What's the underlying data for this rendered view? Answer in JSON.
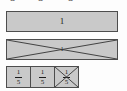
{
  "diagram": {
    "type": "fraction-bar-model",
    "clipped_top_row": {
      "note": "partially cut-off digits along the top edge",
      "glyphs": [
        "5",
        "5",
        "5"
      ]
    },
    "bars": [
      {
        "id": "whole",
        "label": "1",
        "crossed_out": false,
        "fill_color": "#c9c9c9",
        "border_color": "#4d4d4d"
      },
      {
        "id": "crossed-whole",
        "label": "1",
        "crossed_out": true,
        "fill_color": "#c9c9c9",
        "border_color": "#4d4d4d"
      }
    ],
    "parts_row": {
      "denominator": 5,
      "parts": [
        {
          "numerator": "1",
          "denominator": "5",
          "crossed_out": false
        },
        {
          "numerator": "1",
          "denominator": "5",
          "crossed_out": false
        },
        {
          "numerator": "1",
          "denominator": "5",
          "crossed_out": true
        }
      ]
    },
    "colors": {
      "background": "#fdfdfd",
      "bar_fill": "#c9c9c9",
      "bar_border": "#4d4d4d",
      "text": "#1a1a1a",
      "cross_stroke": "#3a3a3a"
    }
  }
}
